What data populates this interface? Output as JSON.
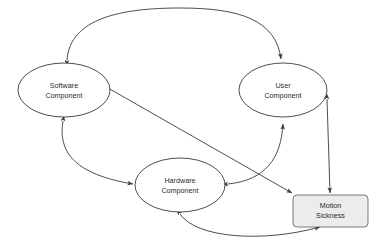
{
  "diagram": {
    "background_color": "#ffffff",
    "line_color": "#3a3a3a",
    "text_color": "#2b2b2b",
    "box_fill_color": "#ececec",
    "box_stroke_color": "#6b6b6b",
    "ellipse_fill_color": "#ffffff",
    "nodes": [
      {
        "id": "software-component",
        "shape": "ellipse",
        "label_line1": "Software",
        "label_line2": "Component",
        "cx": 64,
        "cy": 90,
        "rx": 46,
        "ry": 27
      },
      {
        "id": "user-component",
        "shape": "ellipse",
        "label_line1": "User",
        "label_line2": "Component",
        "cx": 283,
        "cy": 90,
        "rx": 44,
        "ry": 27
      },
      {
        "id": "hardware-component",
        "shape": "ellipse",
        "label_line1": "Hardware",
        "label_line2": "Component",
        "cx": 180,
        "cy": 185,
        "rx": 45,
        "ry": 27
      },
      {
        "id": "motion-sickness",
        "shape": "rounded-rectangle",
        "label_line1": "Motion",
        "label_line2": "Sickness",
        "x": 293,
        "y": 195,
        "width": 75,
        "height": 32,
        "corner_radius": 4
      }
    ],
    "edges": [
      {
        "id": "software-user-arc",
        "from": "software-component",
        "to": "user-component",
        "direction": "bidirectional",
        "style": "curved-arc-top"
      },
      {
        "id": "software-hardware-curve",
        "from": "software-component",
        "to": "hardware-component",
        "direction": "bidirectional",
        "style": "curved-left"
      },
      {
        "id": "hardware-user-curve",
        "from": "hardware-component",
        "to": "user-component",
        "direction": "bidirectional",
        "style": "curved-right"
      },
      {
        "id": "software-motion-sickness-diagonal",
        "from": "software-component",
        "to": "motion-sickness",
        "direction": "bidirectional",
        "style": "straight-diagonal"
      },
      {
        "id": "user-motion-sickness-vertical",
        "from": "user-component",
        "to": "motion-sickness",
        "direction": "bidirectional",
        "style": "straight-vertical"
      },
      {
        "id": "hardware-motion-sickness-curve",
        "from": "hardware-component",
        "to": "motion-sickness",
        "direction": "bidirectional",
        "style": "curved-bottom"
      }
    ]
  }
}
